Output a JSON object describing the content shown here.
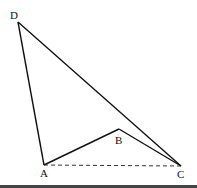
{
  "diagram": {
    "type": "geometry",
    "points": {
      "D": {
        "label": "D",
        "x": 18,
        "y": 22
      },
      "A": {
        "label": "A",
        "x": 44,
        "y": 165
      },
      "B": {
        "label": "B",
        "x": 119,
        "y": 129
      },
      "C": {
        "label": "C",
        "x": 181,
        "y": 166
      }
    },
    "segments": [
      {
        "from": "D",
        "to": "A",
        "style": "solid"
      },
      {
        "from": "D",
        "to": "C",
        "style": "solid"
      },
      {
        "from": "A",
        "to": "B",
        "style": "solid"
      },
      {
        "from": "B",
        "to": "C",
        "style": "solid"
      },
      {
        "from": "A",
        "to": "C",
        "style": "dashed"
      }
    ],
    "stroke_color": "#111111"
  }
}
